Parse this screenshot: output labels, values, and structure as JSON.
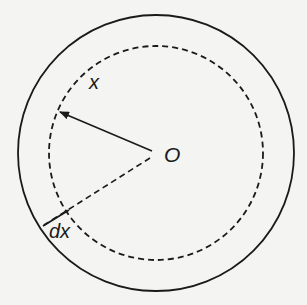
{
  "diagram": {
    "labels": {
      "radius": "x",
      "center": "O",
      "ring_width": "dx"
    },
    "colors": {
      "background": "#f4f4f2",
      "stroke": "#1a1a1a"
    },
    "elements": [
      {
        "name": "outer-circle",
        "style": "solid"
      },
      {
        "name": "inner-circle",
        "style": "dashed"
      },
      {
        "name": "radius-arrow",
        "from": "O",
        "to": "inner-circle"
      },
      {
        "name": "dashed-radius",
        "from": "O",
        "to": "outer-circle"
      },
      {
        "name": "dx-segment",
        "between": [
          "inner-circle",
          "outer-circle"
        ]
      }
    ]
  }
}
